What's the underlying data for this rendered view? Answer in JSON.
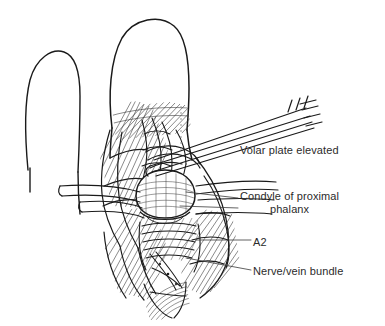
{
  "figure": {
    "kind": "medical-line-illustration",
    "style": "pen-and-ink line drawing",
    "ink_color": "#1a1a1a",
    "background_color": "#ffffff",
    "text_color": "#2b2b2b"
  },
  "labels": {
    "volar_plate": "Volar plate elevated",
    "condyle_line1": "Condyle of proximal",
    "condyle_line2": "phalanx",
    "a2": "A2",
    "nerve_vein": "Nerve/vein bundle"
  },
  "anatomy": {
    "adjacent_finger": "adjacent finger outline",
    "operated_finger": "operated finger with reflected flaps",
    "instrument": "forceps grasping volar plate",
    "retractors": "retractor bands"
  }
}
